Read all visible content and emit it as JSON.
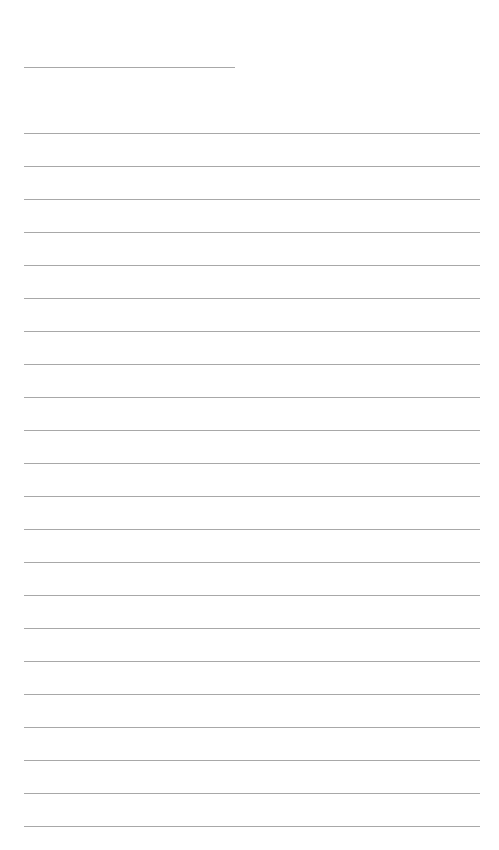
{
  "page": {
    "type": "lined-paper",
    "line_color": "#a8a8a8",
    "title_line": {
      "top": 67,
      "left": 24,
      "width": 211
    },
    "ruled_lines": {
      "count": 22,
      "first_top": 133,
      "spacing": 33,
      "left": 24,
      "width": 456
    }
  }
}
